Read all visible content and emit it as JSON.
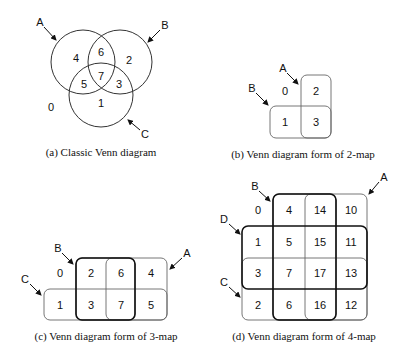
{
  "panels": {
    "a": {
      "caption": "(a) Classic Venn diagram",
      "labels": {
        "A": "A",
        "B": "B",
        "C": "C"
      },
      "regions": {
        "outside": "0",
        "a_only": "4",
        "b_only": "2",
        "c_only": "1",
        "ab": "6",
        "ac": "5",
        "bc": "3",
        "abc": "7"
      }
    },
    "b": {
      "caption": "(b) Venn diagram form of 2-map",
      "labels": {
        "A": "A",
        "B": "B"
      },
      "cells": [
        "0",
        "2",
        "1",
        "3"
      ]
    },
    "c": {
      "caption": "(c) Venn diagram form of 3-map",
      "labels": {
        "A": "A",
        "B": "B",
        "C": "C"
      },
      "rows": [
        [
          "0",
          "2",
          "6",
          "4"
        ],
        [
          "1",
          "3",
          "7",
          "5"
        ]
      ]
    },
    "d": {
      "caption": "(d) Venn diagram form of 4-map",
      "labels": {
        "A": "A",
        "B": "B",
        "C": "C",
        "D": "D"
      },
      "rows": [
        [
          "0",
          "4",
          "14",
          "10"
        ],
        [
          "1",
          "5",
          "15",
          "11"
        ],
        [
          "3",
          "7",
          "17",
          "13"
        ],
        [
          "2",
          "6",
          "16",
          "12"
        ]
      ]
    }
  }
}
